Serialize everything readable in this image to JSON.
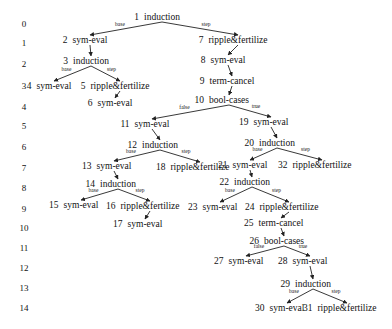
{
  "diagram": {
    "type": "proof-tree",
    "levels": [
      "0",
      "1",
      "2",
      "3",
      "4",
      "5",
      "6",
      "7",
      "8",
      "9",
      "10",
      "11",
      "12",
      "13",
      "14"
    ],
    "nodes": [
      {
        "id": 1,
        "num": "1",
        "label": "induction",
        "x": 162,
        "y": 20
      },
      {
        "id": 2,
        "num": "2",
        "label": "sym-eval",
        "x": 90,
        "y": 43
      },
      {
        "id": 3,
        "num": "3",
        "label": "induction",
        "x": 91,
        "y": 64
      },
      {
        "id": 4,
        "num": "4",
        "label": "sym-eval",
        "x": 54,
        "y": 89
      },
      {
        "id": 5,
        "num": "5",
        "label": "ripple&fertilize",
        "x": 120,
        "y": 89
      },
      {
        "id": 6,
        "num": "6",
        "label": "sym-eval",
        "x": 115,
        "y": 106
      },
      {
        "id": 7,
        "num": "7",
        "label": "ripple&fertilize",
        "x": 238,
        "y": 43
      },
      {
        "id": 8,
        "num": "8",
        "label": "sym-eval",
        "x": 228,
        "y": 63
      },
      {
        "id": 9,
        "num": "9",
        "label": "term-cancel",
        "x": 232,
        "y": 84
      },
      {
        "id": 10,
        "num": "10",
        "label": "bool-cases",
        "x": 229,
        "y": 103
      },
      {
        "id": 11,
        "num": "11",
        "label": "sym-eval",
        "x": 152,
        "y": 127
      },
      {
        "id": 12,
        "num": "12",
        "label": "induction",
        "x": 160,
        "y": 148
      },
      {
        "id": 13,
        "num": "13",
        "label": "sym-eval",
        "x": 114,
        "y": 169
      },
      {
        "id": 14,
        "num": "14",
        "label": "induction",
        "x": 118,
        "y": 187
      },
      {
        "id": 15,
        "num": "15",
        "label": "sym-eval",
        "x": 81,
        "y": 208
      },
      {
        "id": 16,
        "num": "16",
        "label": "ripple&fertilize",
        "x": 150,
        "y": 209
      },
      {
        "id": 17,
        "num": "17",
        "label": "sym-eval",
        "x": 145,
        "y": 227
      },
      {
        "id": 18,
        "num": "18",
        "label": "ripple&fertilize",
        "x": 200,
        "y": 170
      },
      {
        "id": 19,
        "num": "19",
        "label": "sym-eval",
        "x": 271,
        "y": 125
      },
      {
        "id": 20,
        "num": "20",
        "label": "induction",
        "x": 277,
        "y": 146
      },
      {
        "id": 21,
        "num": "21",
        "label": "sym-eval",
        "x": 250,
        "y": 168
      },
      {
        "id": 22,
        "num": "22",
        "label": "induction",
        "x": 252,
        "y": 185
      },
      {
        "id": 23,
        "num": "23",
        "label": "sym-eval",
        "x": 220,
        "y": 210
      },
      {
        "id": 24,
        "num": "24",
        "label": "ripple&fertilize",
        "x": 289,
        "y": 210
      },
      {
        "id": 25,
        "num": "25",
        "label": "term-cancel",
        "x": 281,
        "y": 226
      },
      {
        "id": 26,
        "num": "26",
        "label": "bool-cases",
        "x": 284,
        "y": 244
      },
      {
        "id": 27,
        "num": "27",
        "label": "sym-eval",
        "x": 246,
        "y": 264
      },
      {
        "id": 28,
        "num": "28",
        "label": "sym-eval",
        "x": 310,
        "y": 264
      },
      {
        "id": 29,
        "num": "29",
        "label": "induction",
        "x": 313,
        "y": 287
      },
      {
        "id": 30,
        "num": "30",
        "label": "sym-eval",
        "x": 287,
        "y": 311
      },
      {
        "id": 31,
        "num": "31",
        "label": "ripple&fertilize",
        "x": 347,
        "y": 311
      },
      {
        "id": 32,
        "num": "32",
        "label": "ripple&fertilize",
        "x": 322,
        "y": 168
      }
    ],
    "edges": [
      {
        "from": 1,
        "to": 2,
        "label": "base"
      },
      {
        "from": 1,
        "to": 7,
        "label": "step"
      },
      {
        "from": 2,
        "to": 3,
        "label": ""
      },
      {
        "from": 3,
        "to": 4,
        "label": "base"
      },
      {
        "from": 3,
        "to": 5,
        "label": "step"
      },
      {
        "from": 5,
        "to": 6,
        "label": ""
      },
      {
        "from": 7,
        "to": 8,
        "label": ""
      },
      {
        "from": 8,
        "to": 9,
        "label": ""
      },
      {
        "from": 9,
        "to": 10,
        "label": ""
      },
      {
        "from": 10,
        "to": 11,
        "label": "false"
      },
      {
        "from": 10,
        "to": 19,
        "label": "true"
      },
      {
        "from": 11,
        "to": 12,
        "label": ""
      },
      {
        "from": 12,
        "to": 13,
        "label": "base"
      },
      {
        "from": 12,
        "to": 18,
        "label": "step"
      },
      {
        "from": 13,
        "to": 14,
        "label": ""
      },
      {
        "from": 14,
        "to": 15,
        "label": "base"
      },
      {
        "from": 14,
        "to": 16,
        "label": "step"
      },
      {
        "from": 16,
        "to": 17,
        "label": ""
      },
      {
        "from": 19,
        "to": 20,
        "label": ""
      },
      {
        "from": 20,
        "to": 21,
        "label": "base"
      },
      {
        "from": 20,
        "to": 32,
        "label": "step"
      },
      {
        "from": 21,
        "to": 22,
        "label": ""
      },
      {
        "from": 22,
        "to": 23,
        "label": "base"
      },
      {
        "from": 22,
        "to": 24,
        "label": "step"
      },
      {
        "from": 24,
        "to": 25,
        "label": ""
      },
      {
        "from": 25,
        "to": 26,
        "label": ""
      },
      {
        "from": 26,
        "to": 27,
        "label": "false"
      },
      {
        "from": 26,
        "to": 28,
        "label": "true"
      },
      {
        "from": 28,
        "to": 29,
        "label": ""
      },
      {
        "from": 29,
        "to": 30,
        "label": "base"
      },
      {
        "from": 29,
        "to": 31,
        "label": "step"
      }
    ]
  }
}
